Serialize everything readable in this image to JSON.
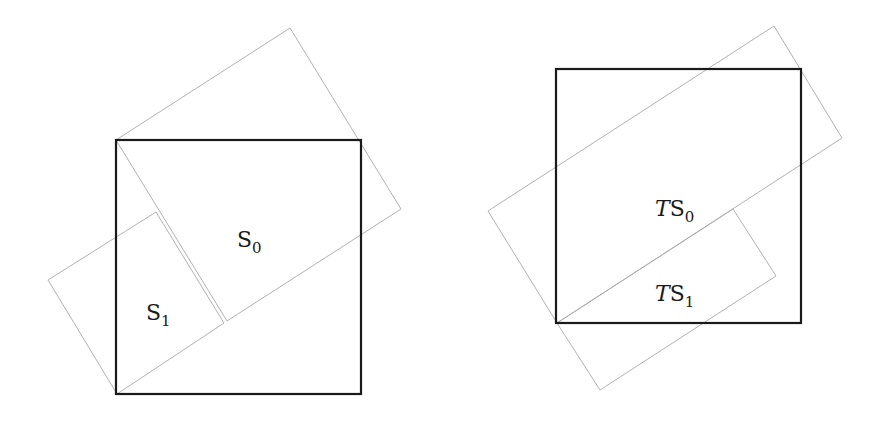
{
  "figure": {
    "left_panel": {
      "square": {
        "x": 116,
        "y": 140,
        "w": 245,
        "h": 254
      },
      "rect_S0": {
        "points": "116,140 290,28 401,209 227,321"
      },
      "rect_S1": {
        "points": "156,212 48,280 117,394 224,323"
      },
      "label_S0": {
        "main": "S",
        "sub": "0",
        "x": 237,
        "y": 247
      },
      "label_S1": {
        "main": "S",
        "sub": "1",
        "x": 146,
        "y": 320
      }
    },
    "right_panel": {
      "square": {
        "x": 556,
        "y": 69,
        "w": 245,
        "h": 254
      },
      "rect_TS0": {
        "points": "488,211 774,26 842,138 557,323"
      },
      "rect_TS1": {
        "points": "557,323 733,209 776,276 600,390"
      },
      "label_TS0": {
        "prefix": "T",
        "main": "S",
        "sub": "0",
        "x": 655,
        "y": 216
      },
      "label_TS1": {
        "prefix": "T",
        "main": "S",
        "sub": "1",
        "x": 655,
        "y": 301
      }
    },
    "colors": {
      "square_stroke": "#1a1a1a",
      "rect_stroke": "#a8a8a8"
    }
  }
}
